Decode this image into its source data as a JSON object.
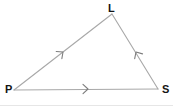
{
  "figure": {
    "type": "geometry-diagram",
    "shape": "triangle",
    "name": "triangle-PLS",
    "background_color": "#ffffff",
    "line_color": "#a8a8a8",
    "label_color": "#141414",
    "border_color": "#e2e2e2",
    "width": 173,
    "height": 107
  },
  "vertices": [
    {
      "id": "L",
      "label": "L",
      "x": 112,
      "y": 14,
      "label_x": 108,
      "label_y": 3
    },
    {
      "id": "P",
      "label": "P",
      "x": 14,
      "y": 90,
      "label_x": 5,
      "label_y": 84
    },
    {
      "id": "S",
      "label": "S",
      "x": 158,
      "y": 89,
      "label_x": 162,
      "label_y": 84
    }
  ],
  "sides": [
    {
      "id": "PL",
      "name": "side-PL",
      "from": "P",
      "to": "L",
      "x1": 14,
      "y1": 90,
      "x2": 112,
      "y2": 14,
      "marker": "single-arrowhead",
      "marker_direction": "toward-L",
      "marker_x": 63,
      "marker_y": 52
    },
    {
      "id": "LS",
      "name": "side-LS",
      "from": "L",
      "to": "S",
      "x1": 112,
      "y1": 14,
      "x2": 158,
      "y2": 89,
      "marker": "single-arrowhead",
      "marker_direction": "toward-L",
      "marker_x": 136,
      "marker_y": 52
    },
    {
      "id": "PS",
      "name": "side-PS",
      "from": "P",
      "to": "S",
      "x1": 14,
      "y1": 90,
      "x2": 158,
      "y2": 89,
      "marker": "single-arrowhead",
      "marker_direction": "toward-S",
      "marker_x": 88,
      "marker_y": 89
    }
  ]
}
